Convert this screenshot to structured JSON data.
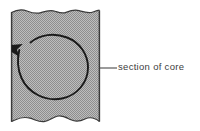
{
  "figure": {
    "type": "geological-cross-section-diagram",
    "background_color": "#ffffff",
    "core_block": {
      "name": "section of core",
      "fill_color": "#a9a9a9",
      "fill_pattern": "fine-stipple-checkerboard",
      "outline_color": "#3a3a3a",
      "left_edge_x": 11,
      "right_edge_x": 100,
      "top_edge_y": 9,
      "bottom_edge_y": 122,
      "top_edge_style": "wavy-torn",
      "bottom_edge_style": "wavy-scalloped"
    },
    "flow_arrow": {
      "name": "circular-flow-arrow",
      "shape": "near-closed-circle",
      "direction": "counterclockwise",
      "stroke_color": "#1a1a1a",
      "center_x": 53,
      "center_y": 67,
      "radius_x": 35,
      "radius_y": 32,
      "arrowhead_position": "left-side-pointing-up"
    },
    "leader_line": {
      "name": "leader-line",
      "color": "#4a4a4a",
      "start_x": 100,
      "end_x": 117,
      "y": 68
    }
  },
  "labels": {
    "section_of_core": "section of core"
  },
  "colors": {
    "core_fill": "#a9a9a9",
    "outline": "#3a3a3a",
    "arrow": "#1a1a1a",
    "text": "#3d3d3d",
    "background": "#ffffff"
  }
}
